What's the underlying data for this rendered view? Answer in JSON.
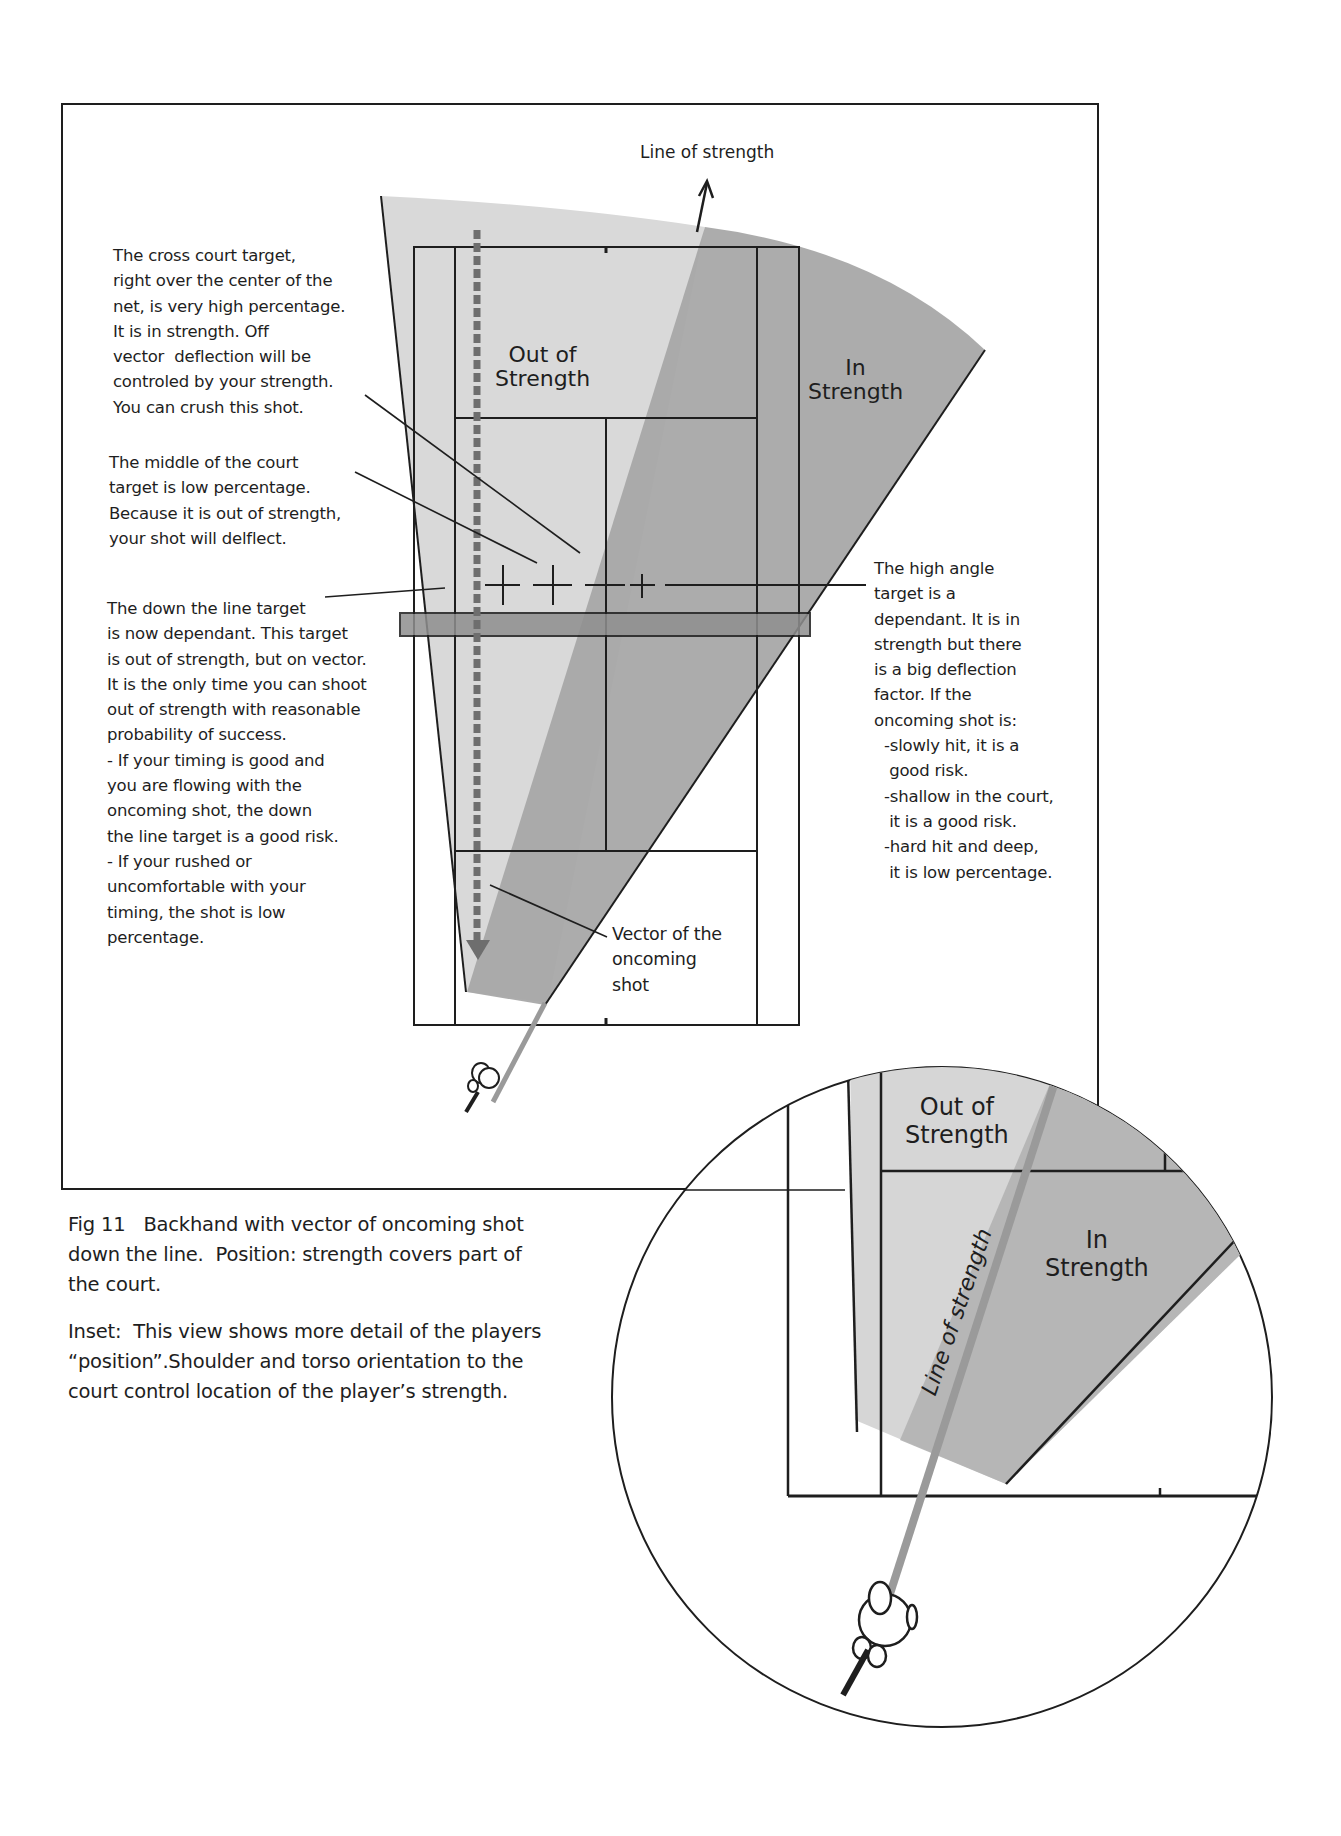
{
  "figure": {
    "title_label": "Line of strength",
    "zones": {
      "out_of_strength": "Out of\nStrength",
      "in_strength": "In\nStrength"
    },
    "vector_label": "Vector of the\noncoming\nshot",
    "annotations": {
      "cross_court": "The cross court target,\nright over the center of the\nnet, is very high percentage.\nIt is in strength. Off\nvector  deflection will be\ncontroled by your strength.\nYou can crush this shot.",
      "middle": "The middle of the court\ntarget is low percentage.\nBecause it is out of strength,\nyour shot will delflect.",
      "down_the_line": "The down the line target\nis now dependant. This target\nis out of strength, but on vector.\nIt is the only time you can shoot\nout of strength with reasonable\nprobability of success.\n- If your timing is good and\nyou are flowing with the\noncoming shot, the down\nthe line target is a good risk.\n- If your rushed or\nuncomfortable with your\ntiming, the shot is low\npercentage.",
      "high_angle": "The high angle\ntarget is a\ndependant. It is in\nstrength but there\nis a big deflection\nfactor. If the\noncoming shot is:\n  -slowly hit, it is a\n   good risk.\n  -shallow in the court,\n   it is a good risk.\n  -hard hit and deep,\n   it is low percentage."
    },
    "colors": {
      "light_zone": "#d9d9d9",
      "dark_zone": "#a6a6a6",
      "vector_arrow": "#6e6e6e",
      "line_of_strength": "#9a9a9a",
      "ink": "#1e1e1e"
    }
  },
  "inset": {
    "zones": {
      "out_of_strength": "Out of\nStrength",
      "in_strength": "In\nStrength"
    },
    "line_label": "Line of strength"
  },
  "caption": {
    "figure": "Fig 11   Backhand with vector of oncoming shot\ndown the line.  Position: strength covers part of\nthe court.",
    "inset": "Inset:  This view shows more detail of the players\n“position”.Shoulder and torso orientation to the\ncourt control location of the player’s strength."
  }
}
